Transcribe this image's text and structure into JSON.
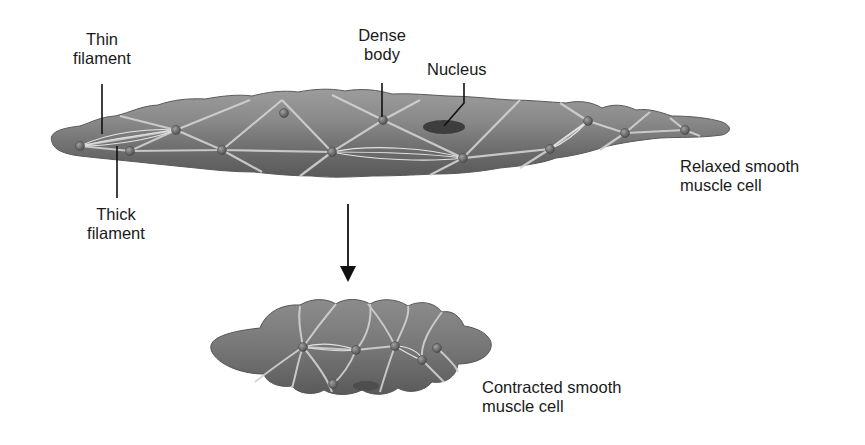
{
  "diagram": {
    "labels": {
      "thin_filament": {
        "line1": "Thin",
        "line2": "filament"
      },
      "thick_filament": {
        "line1": "Thick",
        "line2": "filament"
      },
      "dense_body": {
        "line1": "Dense",
        "line2": "body"
      },
      "nucleus": {
        "line1": "Nucleus"
      },
      "relaxed": {
        "line1": "Relaxed smooth",
        "line2": "muscle cell"
      },
      "contracted": {
        "line1": "Contracted smooth",
        "line2": "muscle cell"
      }
    },
    "arrow": {
      "direction": "down",
      "meaning": "contraction"
    },
    "colors": {
      "cell_fill": "#7a7a7a",
      "cell_highlight": "#a8a8a8",
      "cell_shadow": "#555555",
      "filament_lines": "#d8d8d8",
      "dense_body": "#6a6a6a",
      "nucleus": "#3e3e3e",
      "text": "#1a1a1a",
      "background": "#ffffff"
    }
  }
}
